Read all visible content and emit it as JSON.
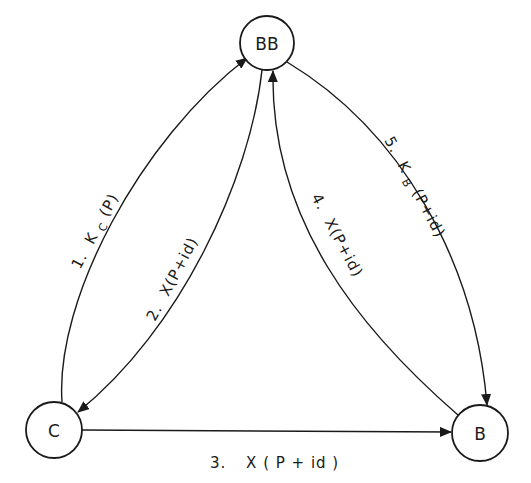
{
  "diagram": {
    "type": "protocol-flow",
    "nodes": [
      {
        "id": "BB",
        "label": "BB",
        "cx": 267,
        "cy": 43,
        "r": 27
      },
      {
        "id": "C",
        "label": "C",
        "cx": 54,
        "cy": 430,
        "r": 28
      },
      {
        "id": "B",
        "label": "B",
        "cx": 480,
        "cy": 433,
        "r": 28
      }
    ],
    "edges": [
      {
        "step": "1.",
        "from": "C",
        "to": "BB",
        "key": "K",
        "subscript": "C",
        "arg": "(P)",
        "label": "1. K_C(P)"
      },
      {
        "step": "2.",
        "from": "BB",
        "to": "C",
        "label": "2. X(P+id)",
        "text": "X(P+id)"
      },
      {
        "step": "3.",
        "from": "C",
        "to": "B",
        "label": "3. X(P+id)",
        "text": "X ( P + id )"
      },
      {
        "step": "4.",
        "from": "B",
        "to": "BB",
        "label": "4. X(P+id)",
        "text": "X(P+id)"
      },
      {
        "step": "5.",
        "from": "BB",
        "to": "B",
        "key": "K",
        "subscript": "B",
        "arg": "(P+id)",
        "label": "5. K_B(P+id)"
      }
    ],
    "colors": {
      "stroke": "#1a1a1a",
      "background": "#ffffff"
    }
  }
}
